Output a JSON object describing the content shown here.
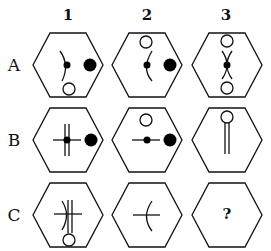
{
  "puzzle": {
    "columns": [
      "1",
      "2",
      "3"
    ],
    "rows": [
      "A",
      "B",
      "C"
    ],
    "missing_cell_label": "?",
    "cells": {
      "A1": {
        "elements": [
          "left-curved-arc",
          "small-black-dot-center",
          "large-black-dot-right",
          "white-circle-bottom"
        ]
      },
      "A2": {
        "elements": [
          "white-circle-top",
          "curved-arc",
          "small-black-dot-center",
          "large-black-dot-right"
        ]
      },
      "A3": {
        "elements": [
          "white-circle-top",
          "x-crossing-curves",
          "small-black-dot-center",
          "white-circle-bottom"
        ]
      },
      "B1": {
        "elements": [
          "double-vertical-lines",
          "horizontal-line",
          "small-black-dot-center",
          "large-black-dot-right"
        ]
      },
      "B2": {
        "elements": [
          "white-circle-top",
          "horizontal-line",
          "small-black-dot-center",
          "large-black-dot-right"
        ]
      },
      "B3": {
        "elements": [
          "white-circle-top",
          "double-vertical-lines"
        ]
      },
      "C1": {
        "elements": [
          "double-vertical-lines",
          "horizontal-line",
          "left-curved-arc",
          "white-circle-bottom"
        ]
      },
      "C2": {
        "elements": [
          "horizontal-line",
          "curved-arc"
        ]
      },
      "C3": {
        "elements": [
          "question-mark"
        ]
      }
    },
    "colors": {
      "stroke": "#111111",
      "fill_dark": "#000000",
      "fill_light": "#ffffff"
    }
  }
}
